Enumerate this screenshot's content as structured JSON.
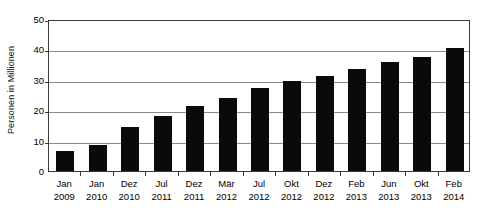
{
  "chart_data": {
    "type": "bar",
    "title": "",
    "xlabel": "",
    "ylabel": "Personen in Millionen",
    "ylim": [
      0,
      50
    ],
    "yticks": [
      0,
      10,
      20,
      30,
      40,
      50
    ],
    "ytick_labels": [
      "0",
      "10",
      "20",
      "30",
      "40",
      "50"
    ],
    "grid": "horizontal",
    "legend": "none",
    "bar_color": "#0a0a0a",
    "categories": [
      "Jan 2009",
      "Jan 2010",
      "Dez 2010",
      "Jul 2011",
      "Dez 2011",
      "Mär 2012",
      "Jul 2012",
      "Okt 2012",
      "Dez 2012",
      "Feb 2013",
      "Jun 2013",
      "Okt 2013",
      "Feb 2014"
    ],
    "category_months": [
      "Jan",
      "Jan",
      "Dez",
      "Jul",
      "Dez",
      "Mär",
      "Jul",
      "Okt",
      "Dez",
      "Feb",
      "Jun",
      "Okt",
      "Feb"
    ],
    "category_years": [
      "2009",
      "2010",
      "2010",
      "2011",
      "2011",
      "2012",
      "2012",
      "2012",
      "2012",
      "2013",
      "2013",
      "2013",
      "2014"
    ],
    "values": [
      6.5,
      8.7,
      14.4,
      18.0,
      21.5,
      24.0,
      27.4,
      29.5,
      31.2,
      33.5,
      35.8,
      37.5,
      40.5
    ]
  }
}
